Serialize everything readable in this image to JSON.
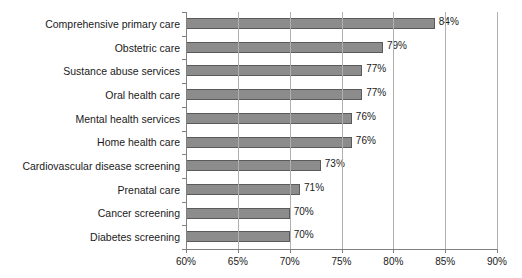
{
  "chart_data": {
    "type": "bar",
    "orientation": "horizontal",
    "title": "",
    "subtitle": "",
    "xlabel": "",
    "ylabel": "",
    "xlim": [
      60,
      90
    ],
    "xticks": [
      60,
      65,
      70,
      75,
      80,
      85,
      90
    ],
    "xtick_labels": [
      "60%",
      "65%",
      "70%",
      "75%",
      "80%",
      "85%",
      "90%"
    ],
    "grid": true,
    "grid_axis": "x",
    "legend": false,
    "legend_position": "none",
    "categories": [
      "Comprehensive primary care",
      "Obstetric care",
      "Sustance abuse services",
      "Oral health care",
      "Mental health services",
      "Home health care",
      "Cardiovascular disease screening",
      "Prenatal care",
      "Cancer screening",
      "Diabetes screening"
    ],
    "values": [
      84,
      79,
      77,
      77,
      76,
      76,
      73,
      71,
      70,
      70
    ],
    "data_labels": [
      "84%",
      "79%",
      "77%",
      "77%",
      "76%",
      "76%",
      "73%",
      "71%",
      "70%",
      "70%"
    ],
    "colors": {
      "bar_fill": "#8c8c8c",
      "bar_border": "#5a5a5a",
      "gridline": "#b0b0b0",
      "axis": "#808080",
      "text": "#1a1a1a",
      "background": "#ffffff"
    }
  }
}
